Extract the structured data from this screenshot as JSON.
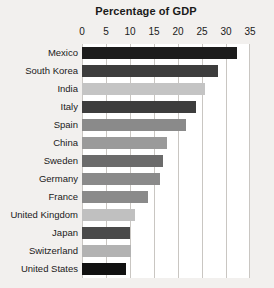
{
  "chart_data": {
    "type": "bar",
    "orientation": "horizontal",
    "title": "Percentage of GDP",
    "xlabel": "",
    "ylabel": "",
    "xlim": [
      0,
      35
    ],
    "xticks": [
      0,
      5,
      10,
      15,
      20,
      25,
      30,
      35
    ],
    "xtick_labels": [
      "0",
      "5",
      "10",
      "15",
      "20",
      "25",
      "30",
      "35"
    ],
    "grid": true,
    "legend": "none",
    "background_color": "#f2f0ee",
    "plot_background_color": "#ffffff",
    "gridline_color": "#c9c6c2",
    "categories": [
      "Mexico",
      "South Korea",
      "India",
      "Italy",
      "Spain",
      "China",
      "Sweden",
      "Germany",
      "France",
      "United Kingdom",
      "Japan",
      "Switzerland",
      "United States"
    ],
    "values": [
      32.2,
      28.3,
      25.6,
      23.8,
      21.7,
      17.7,
      16.9,
      16.3,
      13.8,
      11.0,
      10.0,
      10.2,
      9.2
    ],
    "bar_colors": [
      "#1c1c1c",
      "#3d3d3d",
      "#c4c4c4",
      "#3d3d3d",
      "#8a8a8a",
      "#9a9a9a",
      "#6b6b6b",
      "#8a8a8a",
      "#8a8a8a",
      "#c0c0c0",
      "#4a4a4a",
      "#b2b2b2",
      "#111111"
    ],
    "bars": [
      {
        "label": "Mexico",
        "value": 32.2,
        "color": "#1c1c1c"
      },
      {
        "label": "South Korea",
        "value": 28.3,
        "color": "#3d3d3d"
      },
      {
        "label": "India",
        "value": 25.6,
        "color": "#c4c4c4"
      },
      {
        "label": "Italy",
        "value": 23.8,
        "color": "#3d3d3d"
      },
      {
        "label": "Spain",
        "value": 21.7,
        "color": "#8a8a8a"
      },
      {
        "label": "China",
        "value": 17.7,
        "color": "#9a9a9a"
      },
      {
        "label": "Sweden",
        "value": 16.9,
        "color": "#6b6b6b"
      },
      {
        "label": "Germany",
        "value": 16.3,
        "color": "#8a8a8a"
      },
      {
        "label": "France",
        "value": 13.8,
        "color": "#8a8a8a"
      },
      {
        "label": "United Kingdom",
        "value": 11.0,
        "color": "#c0c0c0"
      },
      {
        "label": "Japan",
        "value": 10.0,
        "color": "#4a4a4a"
      },
      {
        "label": "Switzerland",
        "value": 10.2,
        "color": "#b2b2b2"
      },
      {
        "label": "United States",
        "value": 9.2,
        "color": "#111111"
      }
    ]
  }
}
